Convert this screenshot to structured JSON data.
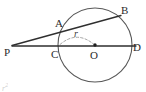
{
  "figure": {
    "background_color": "#ffffff",
    "stroke_color": "#2f2f2f",
    "circle_stroke_color": "#555555",
    "dashed_stroke_color": "#8a8a8a",
    "label_color": "#2b2b2b"
  },
  "circle": {
    "center_label": "O",
    "center_x": 95,
    "center_y": 45,
    "radius": 37
  },
  "points": [
    {
      "id": "P",
      "label": "P",
      "x": 12,
      "y": 45,
      "label_x": 4,
      "label_y": 56,
      "role": "external-point"
    },
    {
      "id": "A",
      "label": "A",
      "x": 62,
      "y": 32,
      "label_x": 55,
      "label_y": 26,
      "role": "secant-near-intersection"
    },
    {
      "id": "B",
      "label": "B",
      "x": 117,
      "y": 17,
      "label_x": 122,
      "label_y": 14,
      "role": "secant-far-intersection"
    },
    {
      "id": "C",
      "label": "C",
      "x": 58,
      "y": 45,
      "label_x": 52,
      "label_y": 57,
      "role": "diameter-near-intersection"
    },
    {
      "id": "D",
      "label": "D",
      "x": 132,
      "y": 45,
      "label_x": 134,
      "label_y": 50,
      "role": "diameter-far-intersection"
    },
    {
      "id": "O",
      "label": "O",
      "x": 95,
      "y": 45,
      "label_x": 91,
      "label_y": 58,
      "role": "center"
    }
  ],
  "segments": [
    {
      "id": "secant",
      "label": "P-A-B",
      "from": "P",
      "to": "B",
      "x1": 12,
      "y1": 45,
      "x2": 120,
      "y2": 16,
      "style": "solid"
    },
    {
      "id": "diameter-line",
      "label": "P-C-O-D",
      "from": "P",
      "to": "D",
      "x1": 12,
      "y1": 46,
      "x2": 135,
      "y2": 46,
      "style": "solid"
    }
  ],
  "radius_annotation": {
    "label": "r",
    "label_x": 77,
    "label_y": 38,
    "style": "dashed-arc",
    "from_x": 60,
    "from_y": 45,
    "to_x": 94,
    "to_y": 45,
    "arc_peak_y": 31
  },
  "artifact": {
    "text": "r",
    "superscript": "2",
    "visible": true
  }
}
